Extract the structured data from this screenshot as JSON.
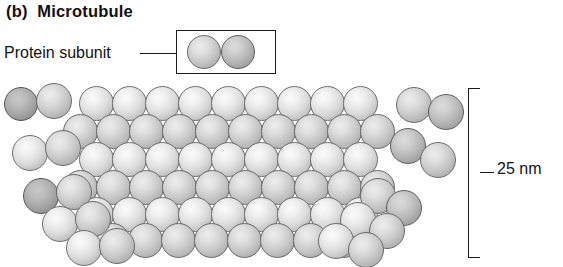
{
  "figure": {
    "panel_label": "(b)",
    "title": "Microtubule",
    "panel_title": "(b)  Microtubule",
    "subunit_label": "Protein subunit",
    "scale_label": "25 nm",
    "icon_names": {
      "legend_box": "legend-box-icon",
      "leader": "leader-line-icon",
      "bracket": "scale-bracket-icon",
      "sphere": "protein-subunit-sphere-icon"
    },
    "colors": {
      "ink": "#1b1b1b",
      "sphere_light": "#f0f0f0",
      "sphere_mid": "#e0e0e0",
      "sphere_dark": "#cfcfcf",
      "sphere_deep": "#bcbcbc",
      "sphere_outline": "#6a6a6a",
      "background": "#ffffff"
    }
  },
  "chart_data": {
    "type": "diagram",
    "title": "(b)  Microtubule",
    "annotations": [
      "Protein subunit",
      "25 nm"
    ],
    "scale": {
      "value": 25,
      "unit": "nm",
      "measures": "microtubule outer diameter"
    },
    "legend": {
      "label": "Protein subunit",
      "glyph": "two adjacent spheres (tubulin dimer)",
      "box": {
        "x": 176,
        "y": 30,
        "w": 100,
        "h": 44
      },
      "spheres": [
        {
          "cx": 204,
          "cy": 52,
          "r": 17,
          "tone": "mid"
        },
        {
          "cx": 238,
          "cy": 52,
          "r": 17,
          "tone": "dark"
        }
      ]
    },
    "bracket": {
      "x": 468,
      "y": 88,
      "w": 12,
      "h": 170,
      "tick_y": 172
    },
    "leader_line": {
      "x1": 140,
      "y1": 53,
      "x2": 177,
      "y2": 53
    },
    "free_dimers": [
      {
        "group": "left-upper",
        "spheres": [
          {
            "cx": 21,
            "cy": 104,
            "r": 17,
            "tone": "deep"
          },
          {
            "cx": 54,
            "cy": 101,
            "r": 18,
            "tone": "mid"
          }
        ]
      },
      {
        "group": "left-lower",
        "spheres": [
          {
            "cx": 30,
            "cy": 153,
            "r": 18,
            "tone": "light"
          },
          {
            "cx": 63,
            "cy": 148,
            "r": 18,
            "tone": "mid"
          }
        ]
      },
      {
        "group": "right-upper",
        "spheres": [
          {
            "cx": 414,
            "cy": 105,
            "r": 18,
            "tone": "mid"
          },
          {
            "cx": 446,
            "cy": 112,
            "r": 18,
            "tone": "dark"
          }
        ]
      },
      {
        "group": "right-lower",
        "spheres": [
          {
            "cx": 408,
            "cy": 146,
            "r": 18,
            "tone": "dark"
          },
          {
            "cx": 438,
            "cy": 160,
            "r": 18,
            "tone": "mid"
          }
        ]
      }
    ],
    "lattice": {
      "description": "staggered hexagonal packing of tubulin spheres forming the microtubule wall",
      "sphere_radius": 17.5,
      "rows": [
        {
          "y": 103,
          "x_start": 96,
          "count": 9,
          "step": 33,
          "tone": "light"
        },
        {
          "y": 131,
          "x_start": 80,
          "count": 10,
          "step": 33,
          "tone": "mid"
        },
        {
          "y": 159,
          "x_start": 96,
          "count": 9,
          "step": 33,
          "tone": "light"
        },
        {
          "y": 187,
          "x_start": 80,
          "count": 10,
          "step": 33,
          "tone": "mid"
        },
        {
          "y": 214,
          "x_start": 96,
          "count": 9,
          "step": 33,
          "tone": "light"
        },
        {
          "y": 240,
          "x_start": 112,
          "count": 8,
          "step": 33,
          "tone": "mid"
        }
      ]
    },
    "tails": {
      "description": "curving strands of subunits flaring away from the tubule wall",
      "left": [
        {
          "cx": 41,
          "cy": 196,
          "r": 18,
          "tone": "deep"
        },
        {
          "cx": 74,
          "cy": 192,
          "r": 18,
          "tone": "mid"
        },
        {
          "cx": 60,
          "cy": 224,
          "r": 18,
          "tone": "light"
        },
        {
          "cx": 93,
          "cy": 219,
          "r": 18,
          "tone": "mid"
        },
        {
          "cx": 84,
          "cy": 248,
          "r": 18,
          "tone": "light"
        },
        {
          "cx": 117,
          "cy": 246,
          "r": 18,
          "tone": "mid"
        }
      ],
      "right": [
        {
          "cx": 378,
          "cy": 196,
          "r": 18,
          "tone": "mid"
        },
        {
          "cx": 404,
          "cy": 208,
          "r": 18,
          "tone": "dark"
        },
        {
          "cx": 358,
          "cy": 220,
          "r": 18,
          "tone": "light"
        },
        {
          "cx": 387,
          "cy": 231,
          "r": 18,
          "tone": "mid"
        },
        {
          "cx": 336,
          "cy": 241,
          "r": 18,
          "tone": "light"
        },
        {
          "cx": 366,
          "cy": 250,
          "r": 18,
          "tone": "mid"
        }
      ]
    }
  }
}
